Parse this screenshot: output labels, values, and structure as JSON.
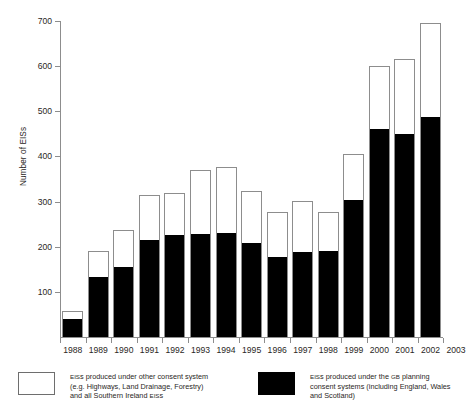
{
  "chart_data": {
    "type": "bar",
    "subtype": "stacked-vertical",
    "title": "",
    "xlabel": "",
    "ylabel": "Number of EISs",
    "ylim": [
      0,
      700
    ],
    "yticks": [
      0,
      100,
      200,
      300,
      400,
      500,
      600,
      700
    ],
    "ytick_labels": [
      "",
      "100",
      "200",
      "300",
      "400",
      "500",
      "600",
      "700"
    ],
    "grid": false,
    "legend_position": "bottom",
    "categories": [
      "1988",
      "1989",
      "1990",
      "1991",
      "1992",
      "1993",
      "1994",
      "1995",
      "1996",
      "1997",
      "1998",
      "1999",
      "2000",
      "2001",
      "2002",
      "2003"
    ],
    "series": [
      {
        "name": "EISs produced under the GB planning consent systems (including England, Wales and Scotland)",
        "short_name": "GB planning consent systems",
        "color": "#000000",
        "values": [
          40,
          134,
          156,
          215,
          227,
          228,
          231,
          209,
          177,
          188,
          191,
          304,
          461,
          449,
          487,
          0
        ]
      },
      {
        "name": "EISs produced under other consent system (e.g. Highways, Land Drainage, Forestry) and all Southern Ireland EISs",
        "short_name": "Other consent system",
        "color": "#ffffff",
        "values": [
          17,
          56,
          80,
          100,
          93,
          142,
          146,
          115,
          99,
          114,
          85,
          102,
          139,
          166,
          209,
          0
        ]
      }
    ],
    "totals": [
      57,
      190,
      236,
      315,
      320,
      370,
      377,
      324,
      276,
      302,
      276,
      406,
      600,
      615,
      696,
      0
    ]
  },
  "axis": {
    "y_title": "Number of EISs"
  },
  "legend": {
    "entries": [
      {
        "swatch": "open-square",
        "line1_a": "EIS",
        "line1_b": "s produced under other consent system",
        "line2": "(e.g. Highways, Land Drainage, Forestry)",
        "line3_a": "and all Southern Ireland ",
        "line3_b": "EIS",
        "line3_c": "s"
      },
      {
        "swatch": "filled-square",
        "line1_a": "EIS",
        "line1_b": "s produced under the ",
        "line1_c": "GB",
        "line1_d": " planning",
        "line2": "consent systems (including England, Wales",
        "line3": "and Scotland)"
      }
    ]
  }
}
